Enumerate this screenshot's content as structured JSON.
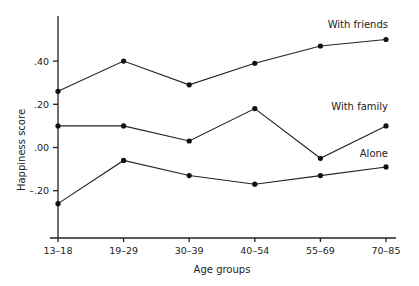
{
  "chart_data": {
    "type": "line",
    "title": "",
    "xlabel": "Age groups",
    "ylabel": "Happiness score",
    "categories": [
      "13–18",
      "19–29",
      "30–39",
      "40–54",
      "55–69",
      "70–85"
    ],
    "ylim": [
      -0.42,
      0.55
    ],
    "yticks": [
      {
        "value": 0.4,
        "label": ".40"
      },
      {
        "value": 0.2,
        "label": ".20"
      },
      {
        "value": 0.0,
        "label": ".00"
      },
      {
        "value": -0.2,
        "label": "–.20"
      }
    ],
    "grid": false,
    "legend": "inline labels at right end of each line",
    "series": [
      {
        "name": "With friends",
        "values": [
          0.26,
          0.4,
          0.29,
          0.39,
          0.47,
          0.5
        ]
      },
      {
        "name": "With family",
        "values": [
          0.1,
          0.1,
          0.03,
          0.18,
          -0.05,
          0.1
        ]
      },
      {
        "name": "Alone",
        "values": [
          -0.26,
          -0.06,
          -0.13,
          -0.17,
          -0.13,
          -0.09
        ]
      }
    ]
  }
}
